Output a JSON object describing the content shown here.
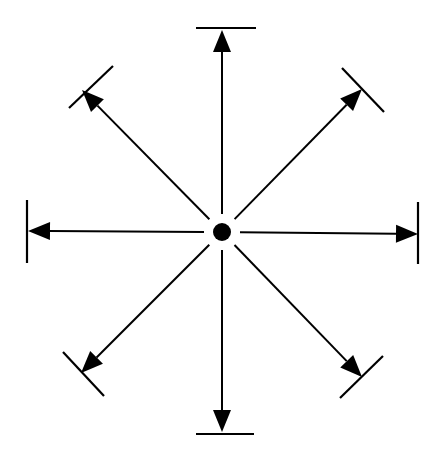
{
  "diagram": {
    "type": "radial-arrows",
    "center": {
      "x": 222,
      "y": 232,
      "radius": 9
    },
    "colors": {
      "stroke": "#000000",
      "background": "#ffffff"
    },
    "arrows": [
      {
        "direction": "north",
        "tip": [
          222,
          30
        ],
        "bar": [
          [
            196,
            28
          ],
          [
            256,
            28
          ]
        ]
      },
      {
        "direction": "northeast",
        "tip": [
          362,
          89
        ],
        "bar": [
          [
            342,
            68
          ],
          [
            384,
            112
          ]
        ]
      },
      {
        "direction": "east",
        "tip": [
          418,
          234
        ],
        "bar": [
          [
            418,
            202
          ],
          [
            418,
            264
          ]
        ]
      },
      {
        "direction": "southeast",
        "tip": [
          362,
          377
        ],
        "bar": [
          [
            340,
            398
          ],
          [
            383,
            356
          ]
        ]
      },
      {
        "direction": "south",
        "tip": [
          222,
          432
        ],
        "bar": [
          [
            196,
            434
          ],
          [
            254,
            434
          ]
        ]
      },
      {
        "direction": "southwest",
        "tip": [
          81,
          373
        ],
        "bar": [
          [
            63,
            352
          ],
          [
            104,
            396
          ]
        ]
      },
      {
        "direction": "west",
        "tip": [
          28,
          231
        ],
        "bar": [
          [
            27,
            200
          ],
          [
            27,
            263
          ]
        ]
      },
      {
        "direction": "northwest",
        "tip": [
          82,
          90
        ],
        "bar": [
          [
            69,
            108
          ],
          [
            113,
            66
          ]
        ]
      }
    ]
  }
}
